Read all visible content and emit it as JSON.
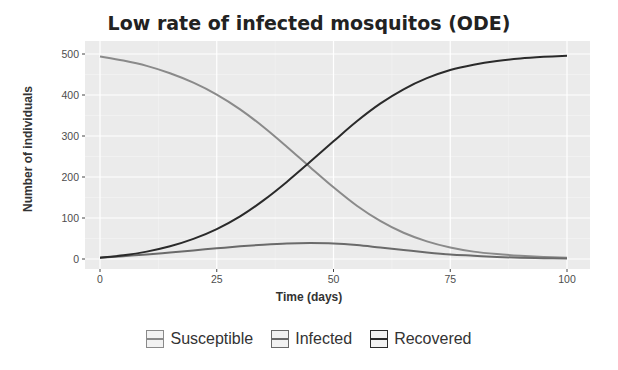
{
  "chart_data": {
    "type": "line",
    "title": "Low rate of infected mosquitos (ODE)",
    "xlabel": "Time (days)",
    "ylabel": "Number of individuals",
    "xlim": [
      0,
      100
    ],
    "ylim": [
      0,
      500
    ],
    "xticks": [
      0,
      25,
      50,
      75,
      100
    ],
    "yticks": [
      0,
      100,
      200,
      300,
      400,
      500
    ],
    "grid": true,
    "legend_position": "bottom",
    "x": [
      0,
      5,
      10,
      15,
      20,
      25,
      30,
      35,
      40,
      45,
      50,
      55,
      60,
      65,
      70,
      75,
      80,
      85,
      90,
      95,
      100
    ],
    "series": [
      {
        "name": "Susceptible",
        "color": "#8a8a8a",
        "values": [
          494,
          484,
          471,
          453,
          430,
          401,
          365,
          322,
          274,
          224,
          175,
          130,
          93,
          64,
          43,
          28,
          18,
          12,
          8,
          5,
          3
        ]
      },
      {
        "name": "Infected",
        "color": "#6a6a6a",
        "values": [
          3,
          7,
          11,
          16,
          21,
          26,
          31,
          35,
          38,
          39,
          38,
          34,
          28,
          22,
          16,
          11,
          8,
          5,
          3,
          2,
          1
        ]
      },
      {
        "name": "Recovered",
        "color": "#2a2a2a",
        "values": [
          3,
          9,
          18,
          31,
          49,
          73,
          104,
          143,
          188,
          237,
          287,
          336,
          379,
          414,
          441,
          461,
          474,
          483,
          489,
          493,
          496
        ]
      }
    ]
  },
  "labels": {
    "title": "Low rate of infected mosquitos (ODE)",
    "xlabel": "Time (days)",
    "ylabel": "Number of individuals",
    "legend": [
      "Susceptible",
      "Infected",
      "Recovered"
    ]
  }
}
